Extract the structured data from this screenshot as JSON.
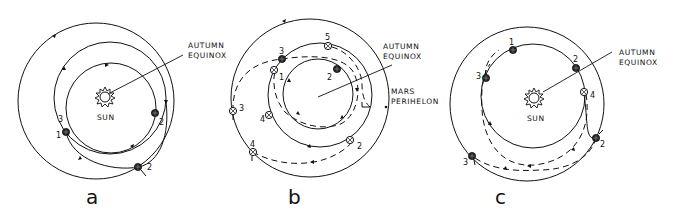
{
  "panels": [
    {
      "id": "a",
      "letter": "a",
      "sun_label": "SUN",
      "equinox_label_line1": "AUTUMN",
      "equinox_label_line2": "EQUINOX",
      "points": [
        {
          "label": "1",
          "kind": "planet"
        },
        {
          "label": "2",
          "kind": "planet"
        },
        {
          "label": "2",
          "kind": "planet"
        },
        {
          "label": "3",
          "kind": "marker"
        }
      ]
    },
    {
      "id": "b",
      "letter": "b",
      "equinox_label_line1": "AUTUMN",
      "equinox_label_line2": "EQUINOX",
      "perihelion_label_line1": "MARS",
      "perihelion_label_line2": "PERIHELON",
      "points": [
        {
          "label": "1"
        },
        {
          "label": "2"
        },
        {
          "label": "2"
        },
        {
          "label": "3"
        },
        {
          "label": "3"
        },
        {
          "label": "4"
        },
        {
          "label": "4"
        },
        {
          "label": "5"
        }
      ]
    },
    {
      "id": "c",
      "letter": "c",
      "sun_label": "SUN",
      "equinox_label_line1": "AUTUMN",
      "equinox_label_line2": "EQUINOX",
      "points": [
        {
          "label": "1"
        },
        {
          "label": "2"
        },
        {
          "label": "2"
        },
        {
          "label": "3"
        },
        {
          "label": "3"
        },
        {
          "label": "4"
        }
      ]
    }
  ]
}
